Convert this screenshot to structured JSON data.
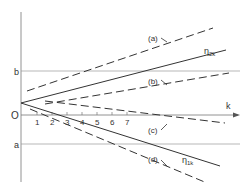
{
  "diagram": {
    "axes": {
      "vertical_labels": {
        "b": "b",
        "origin": "O",
        "a": "a"
      },
      "horizontal_label": "k",
      "ticks": [
        "1",
        "2",
        "3",
        "4",
        "5",
        "6",
        "7"
      ]
    },
    "lines": [
      {
        "id": "a",
        "label": "(a)",
        "style": "dashed"
      },
      {
        "id": "eta2k",
        "label": "η2k",
        "style": "solid"
      },
      {
        "id": "b",
        "label": "(b)",
        "style": "dashed"
      },
      {
        "id": "c",
        "label": "(c)",
        "style": "dashed"
      },
      {
        "id": "eta1k",
        "label": "η1k",
        "style": "solid"
      },
      {
        "id": "d",
        "label": "(d)",
        "style": "dashed"
      }
    ],
    "labels": {
      "a": "(a)",
      "b": "(b)",
      "c": "(c)",
      "d": "(d)",
      "eta2k_main": "η",
      "eta2k_sub": "2k",
      "eta1k_main": "η",
      "eta1k_sub": "1k"
    }
  }
}
